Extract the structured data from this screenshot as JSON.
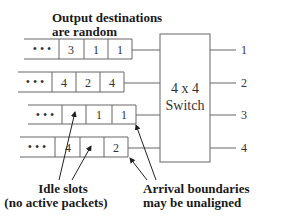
{
  "title_annotation": {
    "line1": "Output destinations",
    "line2": "are random"
  },
  "queues": [
    {
      "id": 1,
      "ellipsis": "• • •",
      "cells": [
        "3",
        "1",
        "1"
      ]
    },
    {
      "id": 2,
      "ellipsis": "• • •",
      "cells": [
        "4",
        "2",
        "4"
      ]
    },
    {
      "id": 3,
      "ellipsis": "• • •",
      "cells": [
        "",
        "1",
        "1"
      ]
    },
    {
      "id": 4,
      "ellipsis": "• • •",
      "cells": [
        "4",
        "",
        "2"
      ]
    }
  ],
  "switch": {
    "line1": "4 x 4",
    "line2": "Switch"
  },
  "outputs": [
    "1",
    "2",
    "3",
    "4"
  ],
  "annotations": {
    "idle": {
      "line1": "Idle slots",
      "line2": "(no active packets)"
    },
    "arrival": {
      "line1": "Arrival boundaries",
      "line2": "may be unaligned"
    }
  },
  "colors": {
    "stroke": "#555555",
    "text": "#1a1a1a",
    "background": "#ffffff"
  }
}
